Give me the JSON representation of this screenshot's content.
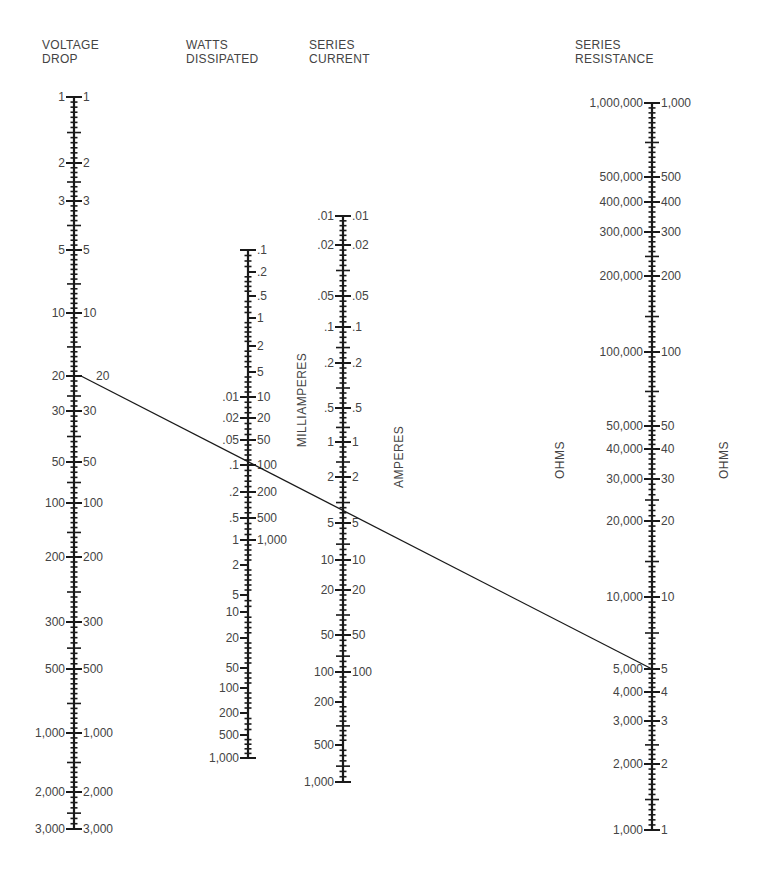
{
  "chart_data": {
    "type": "nomogram",
    "axes": [
      {
        "id": "voltage",
        "title": [
          "VOLTAGE",
          "DROP"
        ],
        "x": 74,
        "scale": "log",
        "range": [
          1,
          3000
        ],
        "left_ticks": [
          {
            "label": "1",
            "y": 97
          },
          {
            "label": "2",
            "y": 163
          },
          {
            "label": "3",
            "y": 201
          },
          {
            "label": "5",
            "y": 250
          },
          {
            "label": "10",
            "y": 313
          },
          {
            "label": "20",
            "y": 376
          },
          {
            "label": "30",
            "y": 411
          },
          {
            "label": "50",
            "y": 462
          },
          {
            "label": "100",
            "y": 503
          },
          {
            "label": "200",
            "y": 557
          },
          {
            "label": "300",
            "y": 622
          },
          {
            "label": "500",
            "y": 669
          },
          {
            "label": "1,000",
            "y": 733
          },
          {
            "label": "2,000",
            "y": 792
          },
          {
            "label": "3,000",
            "y": 829
          }
        ],
        "right_ticks": [
          {
            "label": "1",
            "y": 97
          },
          {
            "label": "2",
            "y": 163
          },
          {
            "label": "3",
            "y": 201
          },
          {
            "label": "5",
            "y": 250
          },
          {
            "label": "10",
            "y": 313
          },
          {
            "label": "20",
            "y": 376,
            "offset": 22
          },
          {
            "label": "30",
            "y": 411
          },
          {
            "label": "50",
            "y": 462
          },
          {
            "label": "100",
            "y": 503
          },
          {
            "label": "200",
            "y": 557
          },
          {
            "label": "300",
            "y": 622
          },
          {
            "label": "500",
            "y": 669
          },
          {
            "label": "1,000",
            "y": 733
          },
          {
            "label": "2,000",
            "y": 792
          },
          {
            "label": "3,000",
            "y": 829
          }
        ],
        "y_top": 97,
        "y_bottom": 829,
        "side_labels": []
      },
      {
        "id": "watts",
        "title": [
          "WATTS",
          "DISSIPATED"
        ],
        "x": 248,
        "scale": "log",
        "range_left_watts": [
          0.01,
          1000
        ],
        "range_right_milliwatts": [
          0.1,
          1000
        ],
        "left_ticks": [
          {
            "label": ".01",
            "y": 397
          },
          {
            "label": ".02",
            "y": 418
          },
          {
            "label": ".05",
            "y": 440
          },
          {
            "label": ".1",
            "y": 465
          },
          {
            "label": ".2",
            "y": 492
          },
          {
            "label": ".5",
            "y": 518
          },
          {
            "label": "1",
            "y": 540
          },
          {
            "label": "2",
            "y": 565
          },
          {
            "label": "5",
            "y": 595
          },
          {
            "label": "10",
            "y": 612
          },
          {
            "label": "20",
            "y": 638
          },
          {
            "label": "50",
            "y": 668
          },
          {
            "label": "100",
            "y": 688
          },
          {
            "label": "200",
            "y": 713
          },
          {
            "label": "500",
            "y": 735
          },
          {
            "label": "1,000",
            "y": 758
          }
        ],
        "right_ticks": [
          {
            "label": ".1",
            "y": 250
          },
          {
            "label": ".2",
            "y": 272
          },
          {
            "label": ".5",
            "y": 296
          },
          {
            "label": "1",
            "y": 318
          },
          {
            "label": "2",
            "y": 346
          },
          {
            "label": "5",
            "y": 372
          },
          {
            "label": "10",
            "y": 397
          },
          {
            "label": "20",
            "y": 418
          },
          {
            "label": "50",
            "y": 440
          },
          {
            "label": "100",
            "y": 465
          },
          {
            "label": "200",
            "y": 492
          },
          {
            "label": "500",
            "y": 518
          },
          {
            "label": "1,000",
            "y": 540
          }
        ],
        "y_top": 250,
        "y_bottom": 758,
        "side_labels": []
      },
      {
        "id": "current",
        "title": [
          "SERIES",
          "CURRENT"
        ],
        "x": 343,
        "scale": "log",
        "range": [
          0.01,
          1000
        ],
        "left_ticks": [
          {
            "label": ".01",
            "y": 216
          },
          {
            "label": ".02",
            "y": 245
          },
          {
            "label": ".05",
            "y": 296
          },
          {
            "label": ".1",
            "y": 327
          },
          {
            "label": ".2",
            "y": 363
          },
          {
            "label": ".5",
            "y": 408
          },
          {
            "label": "1",
            "y": 442
          },
          {
            "label": "2",
            "y": 477
          },
          {
            "label": "5",
            "y": 523
          },
          {
            "label": "10",
            "y": 560
          },
          {
            "label": "20",
            "y": 590
          },
          {
            "label": "50",
            "y": 635
          },
          {
            "label": "100",
            "y": 672
          },
          {
            "label": "200",
            "y": 702
          },
          {
            "label": "500",
            "y": 745
          },
          {
            "label": "1,000",
            "y": 782
          }
        ],
        "right_ticks": [
          {
            "label": ".01",
            "y": 216
          },
          {
            "label": ".02",
            "y": 245
          },
          {
            "label": ".05",
            "y": 296
          },
          {
            "label": ".1",
            "y": 327
          },
          {
            "label": ".2",
            "y": 363
          },
          {
            "label": ".5",
            "y": 408
          },
          {
            "label": "1",
            "y": 442
          },
          {
            "label": "2",
            "y": 477
          },
          {
            "label": "5",
            "y": 523
          },
          {
            "label": "10",
            "y": 560
          },
          {
            "label": "20",
            "y": 590
          },
          {
            "label": "50",
            "y": 635
          },
          {
            "label": "100",
            "y": 672
          }
        ],
        "y_top": 216,
        "y_bottom": 782,
        "side_labels": [
          "MILLIAMPERES",
          "AMPERES"
        ]
      },
      {
        "id": "resistance",
        "title": [
          "SERIES",
          "RESISTANCE"
        ],
        "x": 652,
        "scale": "log",
        "range_left_ohms": [
          1000,
          1000000
        ],
        "range_right_ohms": [
          1,
          1000
        ],
        "left_ticks": [
          {
            "label": "1,000,000",
            "y": 103
          },
          {
            "label": "500,000",
            "y": 177
          },
          {
            "label": "400,000",
            "y": 202
          },
          {
            "label": "300,000",
            "y": 232
          },
          {
            "label": "200,000",
            "y": 276
          },
          {
            "label": "100,000",
            "y": 352
          },
          {
            "label": "50,000",
            "y": 426
          },
          {
            "label": "40,000",
            "y": 449
          },
          {
            "label": "30,000",
            "y": 479
          },
          {
            "label": "20,000",
            "y": 521
          },
          {
            "label": "10,000",
            "y": 597
          },
          {
            "label": "5,000",
            "y": 669
          },
          {
            "label": "4,000",
            "y": 692
          },
          {
            "label": "3,000",
            "y": 721
          },
          {
            "label": "2,000",
            "y": 764
          },
          {
            "label": "1,000",
            "y": 830
          }
        ],
        "right_ticks": [
          {
            "label": "1,000",
            "y": 103
          },
          {
            "label": "500",
            "y": 177
          },
          {
            "label": "400",
            "y": 202
          },
          {
            "label": "300",
            "y": 232
          },
          {
            "label": "200",
            "y": 276
          },
          {
            "label": "100",
            "y": 352
          },
          {
            "label": "50",
            "y": 426
          },
          {
            "label": "40",
            "y": 449
          },
          {
            "label": "30",
            "y": 479
          },
          {
            "label": "20",
            "y": 521
          },
          {
            "label": "10",
            "y": 597
          },
          {
            "label": "5",
            "y": 669
          },
          {
            "label": "4",
            "y": 692
          },
          {
            "label": "3",
            "y": 721
          },
          {
            "label": "2",
            "y": 764
          },
          {
            "label": "1",
            "y": 830
          }
        ],
        "y_top": 103,
        "y_bottom": 830,
        "side_labels": [
          "OHMS",
          "OHMS"
        ]
      }
    ],
    "example_line": {
      "from": {
        "axis": "voltage",
        "value": "20",
        "x": 81,
        "y": 376
      },
      "to": {
        "axis": "resistance",
        "value": "5,000 / 5",
        "x": 652,
        "y": 669
      },
      "crosses": [
        {
          "axis": "watts",
          "value_left": ".08",
          "value_right": "80"
        },
        {
          "axis": "current",
          "value": "4"
        }
      ]
    }
  },
  "headings": {
    "voltage": [
      "VOLTAGE",
      "DROP"
    ],
    "watts": [
      "WATTS",
      "DISSIPATED"
    ],
    "current": [
      "SERIES",
      "CURRENT"
    ],
    "resistance": [
      "SERIES",
      "RESISTANCE"
    ]
  },
  "side_labels": {
    "milliamperes": "MILLIAMPERES",
    "amperes": "AMPERES",
    "ohms_left": "OHMS",
    "ohms_right": "OHMS"
  },
  "colors": {
    "ink": "#1a1a1a",
    "label": "#444444",
    "background": "#ffffff"
  }
}
